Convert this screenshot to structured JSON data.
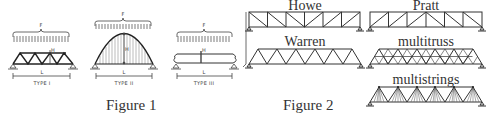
{
  "figure1": {
    "caption": "Figure 1",
    "panels": [
      {
        "id": "type-1",
        "label": "TYPE I",
        "load_label": "F",
        "mid_label": "H",
        "span_label": "L",
        "kind": "truss"
      },
      {
        "id": "type-2",
        "label": "TYPE II",
        "load_label": "F",
        "mid_label": "H",
        "span_label": "L",
        "kind": "arch"
      },
      {
        "id": "type-3",
        "label": "TYPE III",
        "load_label": "F",
        "mid_label": "H",
        "span_label": "L",
        "kind": "beam"
      }
    ]
  },
  "figure2": {
    "caption": "Figure 2",
    "trusses": [
      {
        "id": "howe",
        "label": "Howe"
      },
      {
        "id": "pratt",
        "label": "Pratt"
      },
      {
        "id": "warren",
        "label": "Warren"
      },
      {
        "id": "multitruss",
        "label": "multitruss"
      },
      {
        "id": "multistrings",
        "label": "multistrings"
      }
    ]
  },
  "colors": {
    "line": "#333333",
    "text": "#333333",
    "background": "#ffffff"
  }
}
